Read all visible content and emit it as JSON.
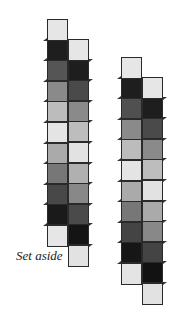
{
  "figure": {
    "label": "Set aside",
    "strips": [
      {
        "name": "left-strip",
        "columns": [
          {
            "name": "left-column",
            "x": 47,
            "top": 19,
            "cells": [
              "#e6e6e6",
              "#1e1e1e",
              "#555555",
              "#8a8a8a",
              "#bcbcbc",
              "#e4e4e4",
              "#aaaaaa",
              "#777777",
              "#484848",
              "#1a1a1a",
              "#e6e6e6"
            ]
          },
          {
            "name": "right-column",
            "x": 68,
            "top": 39,
            "cells": [
              "#e6e6e6",
              "#1e1e1e",
              "#4a4a4a",
              "#8a8a8a",
              "#bdbdbd",
              "#e2e2e2",
              "#b0b0b0",
              "#888888",
              "#4a4a4a",
              "#141414",
              "#e2e2e2"
            ]
          }
        ]
      },
      {
        "name": "right-strip",
        "columns": [
          {
            "name": "left-column",
            "x": 121,
            "top": 57,
            "cells": [
              "#e6e6e6",
              "#1e1e1e",
              "#505050",
              "#8a8a8a",
              "#bcbcbc",
              "#e4e4e4",
              "#aaaaaa",
              "#777777",
              "#444444",
              "#161616",
              "#e4e4e4"
            ]
          },
          {
            "name": "right-column",
            "x": 142,
            "top": 77,
            "cells": [
              "#e6e6e6",
              "#1e1e1e",
              "#4a4a4a",
              "#8a8a8a",
              "#bdbdbd",
              "#e2e2e2",
              "#aaaaaa",
              "#888888",
              "#444444",
              "#121212",
              "#e2e2e2"
            ]
          }
        ]
      }
    ]
  }
}
